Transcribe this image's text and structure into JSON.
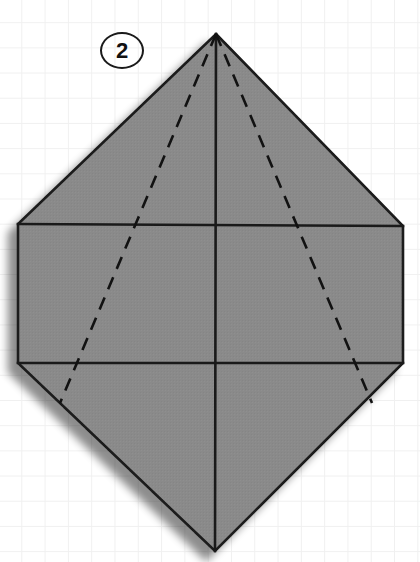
{
  "figure": {
    "step_label": "2",
    "canvas": {
      "width": 420,
      "height": 562
    },
    "colors": {
      "paper_fill": "#8a8a8a",
      "outline": "#1a1a1a",
      "crease_solid": "#1a1a1a",
      "crease_dashed": "#121212",
      "shadow": "#b8b8b8",
      "background": "#ffffff",
      "grid_line": "#f0f0f0"
    },
    "shape": {
      "name": "hexagon-paper",
      "description": "Vertically elongated hexagon: a rectangle with triangular points at top and bottom.",
      "vertices": [
        {
          "name": "top-point",
          "x": 216,
          "y": 34
        },
        {
          "name": "upper-right-corner",
          "x": 403,
          "y": 226
        },
        {
          "name": "lower-right-corner",
          "x": 403,
          "y": 363
        },
        {
          "name": "bottom-point",
          "x": 215,
          "y": 551
        },
        {
          "name": "lower-left-corner",
          "x": 18,
          "y": 363
        },
        {
          "name": "upper-left-corner",
          "x": 18,
          "y": 224
        }
      ]
    },
    "creases": {
      "solid": [
        {
          "name": "upper-horizontal-edge",
          "x1": 18,
          "y1": 224,
          "x2": 403,
          "y2": 226
        },
        {
          "name": "lower-horizontal-edge",
          "x1": 18,
          "y1": 363,
          "x2": 403,
          "y2": 363
        },
        {
          "name": "vertical-center-line",
          "x1": 216,
          "y1": 34,
          "x2": 215,
          "y2": 551
        }
      ],
      "dashed": [
        {
          "name": "left-diagonal-fold",
          "x1": 216,
          "y1": 34,
          "x2": 60,
          "y2": 403
        },
        {
          "name": "right-diagonal-fold",
          "x1": 216,
          "y1": 34,
          "x2": 372,
          "y2": 403
        }
      ],
      "dash_pattern": "13 9",
      "solid_stroke_width": 2.6,
      "dashed_stroke_width": 2.6
    },
    "shadow": {
      "name": "paper-drop-shadow",
      "offset_x": -9,
      "offset_y": 9,
      "blur": 7
    }
  }
}
